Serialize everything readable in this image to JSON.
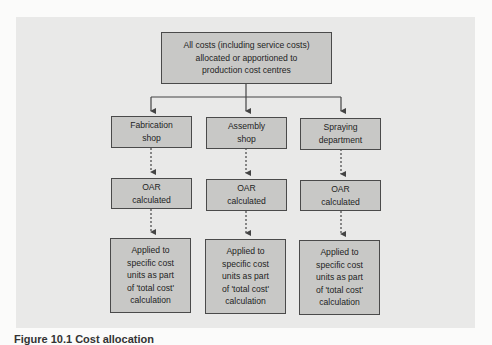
{
  "diagram": {
    "top_box": "All costs (including service costs)\nallocated or apportioned to\nproduction cost centres",
    "columns": [
      {
        "cost_centre": "Fabrication\nshop",
        "oar": "OAR\ncalculated",
        "applied": "Applied to\nspecific cost\nunits as part\nof 'total cost'\ncalculation"
      },
      {
        "cost_centre": "Assembly\nshop",
        "oar": "OAR\ncalculated",
        "applied": "Applied to\nspecific cost\nunits as part\nof 'total cost'\ncalculation"
      },
      {
        "cost_centre": "Spraying\ndepartment",
        "oar": "OAR\ncalculated",
        "applied": "Applied to\nspecific cost\nunits as part\nof 'total cost'\ncalculation"
      }
    ],
    "colors": {
      "panel": "#e9e9e8",
      "box_fill": "#c8c8c6",
      "box_border": "#4a4a4a",
      "connector": "#444444"
    }
  },
  "caption": "Figure 10.1 Cost allocation"
}
